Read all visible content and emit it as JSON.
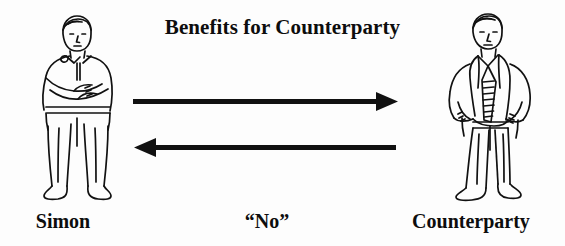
{
  "diagram": {
    "title": "Benefits for Counterparty",
    "background_color": "#fdfdfd",
    "ink_color": "#0d0d0d",
    "figures": [
      {
        "id": "simon",
        "label": "Simon",
        "icon": "standing-man-arms-crossed-icon",
        "description": "Line drawing of a man standing with arms crossed, shirt and trousers"
      },
      {
        "id": "counterparty",
        "label": "Counterparty",
        "icon": "standing-man-hands-on-hips-icon",
        "description": "Line drawing of a man in a suit jacket with striped tie, hands on hips"
      }
    ],
    "arrows": [
      {
        "id": "benefits-arrow",
        "direction": "right",
        "label": "Benefits for Counterparty",
        "label_position": "above",
        "from": "simon",
        "to": "counterparty"
      },
      {
        "id": "no-arrow",
        "direction": "left",
        "label": "“No”",
        "label_position": "below",
        "from": "counterparty",
        "to": "simon"
      }
    ],
    "labels": {
      "left": "Simon",
      "center": "“No”",
      "right": "Counterparty"
    }
  }
}
